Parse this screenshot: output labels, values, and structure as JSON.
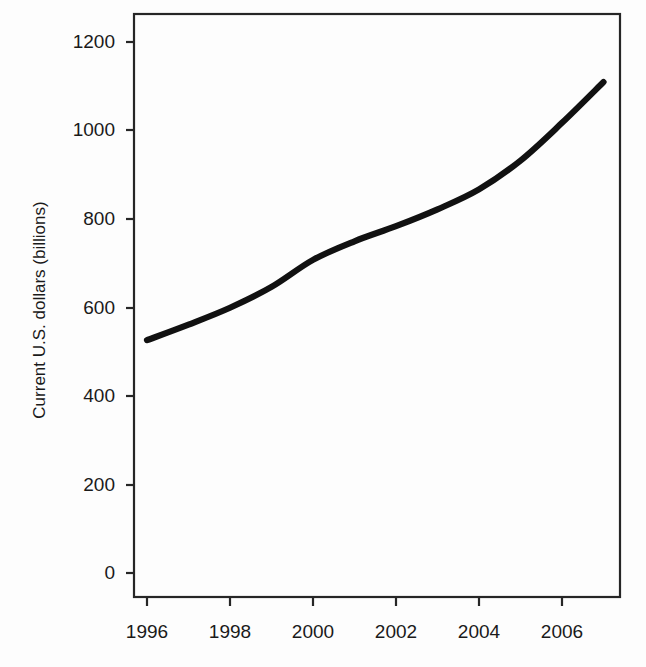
{
  "chart_data": {
    "type": "line",
    "title": "",
    "subtitle": "",
    "xlabel": "",
    "ylabel": "Current U.S. dollars (billions)",
    "x": [
      1996,
      1997,
      1998,
      1999,
      2000,
      2001,
      2002,
      2003,
      2004,
      2005,
      2006,
      2007
    ],
    "values": [
      525,
      560,
      598,
      645,
      706,
      748,
      782,
      820,
      865,
      930,
      1015,
      1107
    ],
    "series": [
      {
        "name": "Current U.S. dollars (billions)",
        "values": [
          525,
          560,
          598,
          645,
          706,
          748,
          782,
          820,
          865,
          930,
          1015,
          1107
        ]
      }
    ],
    "xlim": [
      1995.7,
      2007.3
    ],
    "ylim": [
      0,
      1260
    ],
    "xticks": [
      1996,
      1998,
      2000,
      2002,
      2004,
      2006
    ],
    "xtick_labels": [
      "1996",
      "1998",
      "2000",
      "2002",
      "2004",
      "2006"
    ],
    "yticks": [
      0,
      200,
      400,
      600,
      800,
      1000,
      1200
    ],
    "ytick_labels": [
      "0",
      "200",
      "400",
      "600",
      "800",
      "1000",
      "1200"
    ],
    "grid": false,
    "legend": false,
    "legend_position": "none",
    "line_color": "#111111",
    "frame_color": "#262626",
    "background_color": "#fdfdfd"
  },
  "axes": {
    "y_axis_title": "Current U.S. dollars (billions)",
    "x_axis_title": ""
  }
}
